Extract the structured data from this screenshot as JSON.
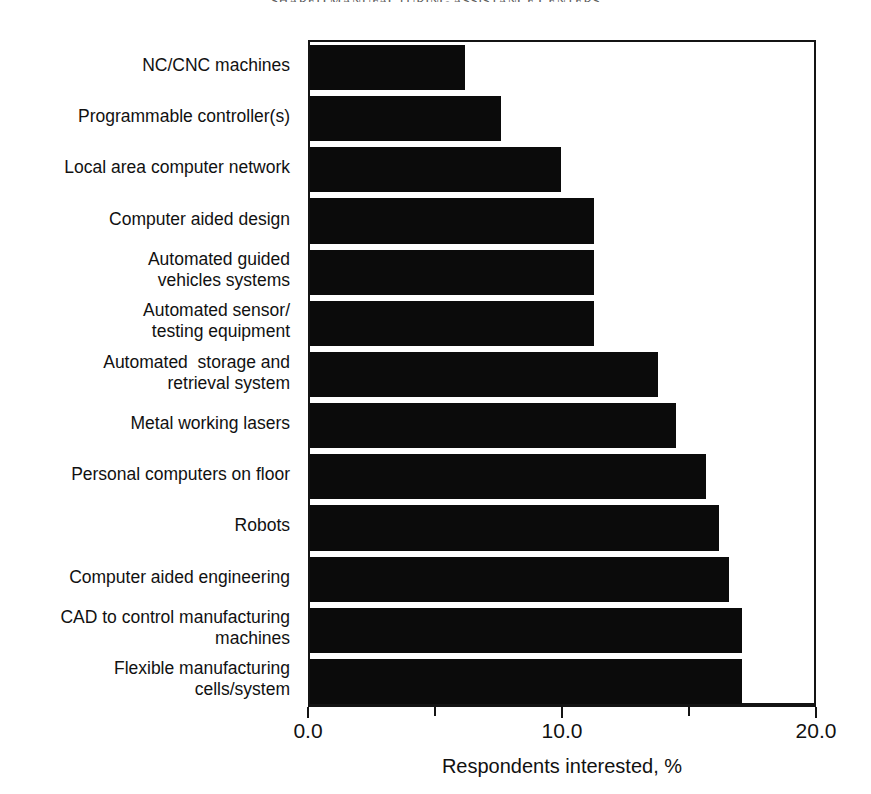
{
  "running_head": "SHARED MANUFACTURING ASSISTANCE CENTERS",
  "axis": {
    "x_title": "Respondents interested, %",
    "ticks": [
      {
        "value": 0.0,
        "label": "0.0",
        "major": true
      },
      {
        "value": 5.0,
        "label": "",
        "major": false
      },
      {
        "value": 10.0,
        "label": "10.0",
        "major": true
      },
      {
        "value": 15.0,
        "label": "",
        "major": false
      },
      {
        "value": 20.0,
        "label": "20.0",
        "major": true
      }
    ]
  },
  "colors": {
    "bar_fill": "#0b0b0b",
    "axis": "#141414",
    "text": "#111111",
    "background": "#ffffff"
  },
  "chart_data": {
    "type": "bar",
    "orientation": "horizontal",
    "title": "",
    "xlabel": "Respondents interested, %",
    "ylabel": "",
    "xlim": [
      0.0,
      20.0
    ],
    "xticks": [
      0.0,
      5.0,
      10.0,
      15.0,
      20.0
    ],
    "xtick_labels": [
      "0.0",
      "",
      "10.0",
      "",
      "20.0"
    ],
    "grid": false,
    "legend": null,
    "categories": [
      "NC/CNC machines",
      "Programmable controller(s)",
      "Local area computer network",
      "Computer aided design",
      "Automated guided\nvehicles systems",
      "Automated sensor/\ntesting equipment",
      "Automated  storage and\nretrieval system",
      "Metal working lasers",
      "Personal computers on floor",
      "Robots",
      "Computer aided engineering",
      "CAD to control manufacturing\nmachines",
      "Flexible manufacturing\ncells/system"
    ],
    "values": [
      6.1,
      7.5,
      9.9,
      11.2,
      11.2,
      11.2,
      13.7,
      14.4,
      15.6,
      16.1,
      16.5,
      17.0,
      17.0
    ]
  }
}
